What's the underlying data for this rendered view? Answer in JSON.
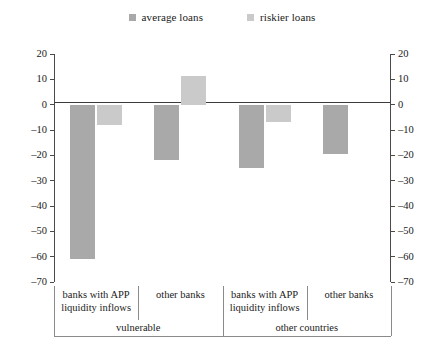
{
  "legend": {
    "items": [
      {
        "label": "average loans",
        "color": "#a9a9a9",
        "key": "average"
      },
      {
        "label": "riskier loans",
        "color": "#cacaca",
        "key": "riskier"
      }
    ]
  },
  "axis": {
    "ticks": [
      "20",
      "10",
      "0",
      "-10",
      "-20",
      "-30",
      "-40",
      "-50",
      "-60",
      "-70"
    ]
  },
  "xaxis": {
    "categories": [
      "banks with APP\nliquidity inflows",
      "other banks",
      "banks with APP\nliquidity inflows",
      "other banks"
    ],
    "groups": [
      "vulnerable",
      "other countries"
    ]
  },
  "chart_data": {
    "type": "bar",
    "title": "",
    "subtitle": "",
    "xlabel": "",
    "ylabel": "",
    "ylim": [
      -70,
      20
    ],
    "ytick_step": 10,
    "grid": false,
    "legend_position": "top-center",
    "categories": [
      "banks with APP liquidity inflows",
      "other banks",
      "banks with APP liquidity inflows",
      "other banks"
    ],
    "supergroups": [
      {
        "name": "vulnerable",
        "categories": [
          0,
          1
        ]
      },
      {
        "name": "other countries",
        "categories": [
          2,
          3
        ]
      }
    ],
    "series": [
      {
        "name": "average loans",
        "color": "#a9a9a9",
        "values": [
          -61,
          -22,
          -25,
          -19.5
        ]
      },
      {
        "name": "riskier loans",
        "color": "#cacaca",
        "values": [
          -8,
          11.5,
          -7,
          null
        ]
      }
    ]
  },
  "colors": {
    "average": "#a9a9a9",
    "riskier": "#cacaca",
    "axis": "#4a4a4a",
    "separator": "#8a8a8a",
    "background": "#ffffff"
  }
}
